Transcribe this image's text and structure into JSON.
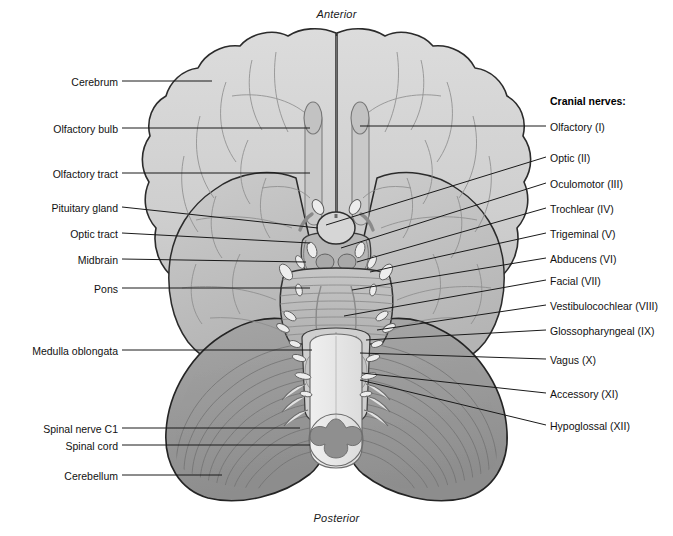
{
  "figure": {
    "orientation": {
      "anterior": "Anterior",
      "posterior": "Posterior"
    },
    "palette": {
      "background": "#ffffff",
      "cerebrum": "#d2d2d2",
      "cerebrum_edge": "#2b2b2b",
      "temporal_lobe": "#c4c4c4",
      "cerebellum": "#9b9b9b",
      "cerebellum_dark": "#8a8a8a",
      "brainstem": "#b9b9b9",
      "pons": "#c0c0c0",
      "medulla": "#cfcfcf",
      "spinal_cord": "#e9e9e9",
      "spinal_gray_matter": "#8f8f8f",
      "pituitary": "#d8d8d8",
      "nerve_root": "#ededed",
      "sulci": "#8c8c8c",
      "leader_line": "#1a1a1a",
      "text": "#111111"
    }
  },
  "labels_left": [
    {
      "id": "cerebrum",
      "text": "Cerebrum",
      "x": 118,
      "y": 76,
      "lx": 122,
      "ly": 81,
      "tx": 212,
      "ty": 81
    },
    {
      "id": "olfactory-bulb",
      "text": "Olfactory bulb",
      "x": 118,
      "y": 123,
      "lx": 122,
      "ly": 128,
      "tx": 310,
      "ty": 128
    },
    {
      "id": "olfactory-tract",
      "text": "Olfactory tract",
      "x": 118,
      "y": 168,
      "lx": 122,
      "ly": 173,
      "tx": 310,
      "ty": 173
    },
    {
      "id": "pituitary-gland",
      "text": "Pituitary gland",
      "x": 118,
      "y": 202,
      "lx": 122,
      "ly": 207,
      "tx": 318,
      "ty": 228
    },
    {
      "id": "optic-tract",
      "text": "Optic tract",
      "x": 118,
      "y": 228,
      "lx": 122,
      "ly": 233,
      "tx": 310,
      "ty": 243
    },
    {
      "id": "midbrain",
      "text": "Midbrain",
      "x": 118,
      "y": 254,
      "lx": 122,
      "ly": 259,
      "tx": 306,
      "ty": 262
    },
    {
      "id": "pons",
      "text": "Pons",
      "x": 118,
      "y": 283,
      "lx": 122,
      "ly": 288,
      "tx": 310,
      "ty": 288
    },
    {
      "id": "medulla-oblongata",
      "text": "Medulla oblongata",
      "x": 118,
      "y": 345,
      "lx": 122,
      "ly": 350,
      "tx": 312,
      "ty": 350
    },
    {
      "id": "spinal-nerve-c1",
      "text": "Spinal nerve C1",
      "x": 118,
      "y": 423,
      "lx": 122,
      "ly": 428,
      "tx": 300,
      "ty": 428
    },
    {
      "id": "spinal-cord",
      "text": "Spinal cord",
      "x": 118,
      "y": 440,
      "lx": 122,
      "ly": 445,
      "tx": 310,
      "ty": 445
    },
    {
      "id": "cerebellum",
      "text": "Cerebellum",
      "x": 118,
      "y": 470,
      "lx": 122,
      "ly": 475,
      "tx": 222,
      "ty": 475
    }
  ],
  "cranial_nerves_heading": "Cranial nerves:",
  "labels_right": [
    {
      "id": "olfactory-i",
      "text": "Olfactory (I)",
      "x": 550,
      "y": 121,
      "lx": 546,
      "ly": 126,
      "tx": 360,
      "ty": 126
    },
    {
      "id": "optic-ii",
      "text": "Optic (II)",
      "x": 550,
      "y": 152,
      "lx": 546,
      "ly": 157,
      "tx": 326,
      "ty": 225
    },
    {
      "id": "oculomotor-iii",
      "text": "Oculomotor (III)",
      "x": 550,
      "y": 178,
      "lx": 546,
      "ly": 183,
      "tx": 341,
      "ty": 248
    },
    {
      "id": "trochlear-iv",
      "text": "Trochlear (IV)",
      "x": 550,
      "y": 203,
      "lx": 546,
      "ly": 208,
      "tx": 357,
      "ty": 262
    },
    {
      "id": "trigeminal-v",
      "text": "Trigeminal (V)",
      "x": 550,
      "y": 228,
      "lx": 546,
      "ly": 233,
      "tx": 370,
      "ty": 272
    },
    {
      "id": "abducens-vi",
      "text": "Abducens (VI)",
      "x": 550,
      "y": 253,
      "lx": 546,
      "ly": 258,
      "tx": 352,
      "ty": 290
    },
    {
      "id": "facial-vii",
      "text": "Facial (VII)",
      "x": 550,
      "y": 275,
      "lx": 546,
      "ly": 280,
      "tx": 344,
      "ty": 316
    },
    {
      "id": "vestibulocochlear-viii",
      "text": "Vestibulocochlear (VIII)",
      "x": 550,
      "y": 300,
      "lx": 546,
      "ly": 305,
      "tx": 377,
      "ty": 330
    },
    {
      "id": "glossopharyngeal-ix",
      "text": "Glossopharyngeal (IX)",
      "x": 550,
      "y": 325,
      "lx": 546,
      "ly": 330,
      "tx": 366,
      "ty": 340
    },
    {
      "id": "vagus-x",
      "text": "Vagus (X)",
      "x": 550,
      "y": 354,
      "lx": 546,
      "ly": 359,
      "tx": 360,
      "ty": 353
    },
    {
      "id": "accessory-xi",
      "text": "Accessory (XI)",
      "x": 550,
      "y": 388,
      "lx": 546,
      "ly": 393,
      "tx": 362,
      "ty": 373
    },
    {
      "id": "hypoglossal-xii",
      "text": "Hypoglossal (XII)",
      "x": 550,
      "y": 420,
      "lx": 546,
      "ly": 425,
      "tx": 360,
      "ty": 380
    }
  ]
}
